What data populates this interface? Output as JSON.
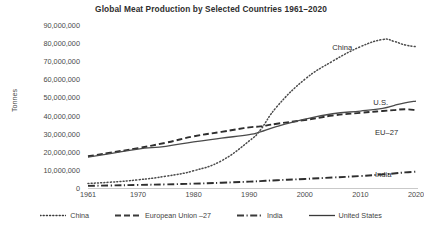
{
  "chart_data": {
    "type": "line",
    "title": "Global Meat Production by Selected Countries 1961–2020",
    "xlabel": "",
    "ylabel": "Tonnes",
    "xlim": [
      1961,
      2020
    ],
    "ylim": [
      0,
      90000000
    ],
    "grid": false,
    "legend_position": "bottom",
    "x_ticks": [
      "1961",
      "1970",
      "1980",
      "1990",
      "2000",
      "2010",
      "2020"
    ],
    "x_tick_values": [
      1961,
      1970,
      1980,
      1990,
      2000,
      2010,
      2020
    ],
    "y_ticks": [
      "90,000,000",
      "80,000,000",
      "70,000,000",
      "60,000,000",
      "50,000,000",
      "40,000,000",
      "30,000,000",
      "20,000,000",
      "10,000,000",
      "0"
    ],
    "y_tick_values": [
      90000000,
      80000000,
      70000000,
      60000000,
      50000000,
      40000000,
      30000000,
      20000000,
      10000000,
      0
    ],
    "x": [
      1961,
      1965,
      1970,
      1975,
      1980,
      1985,
      1990,
      1992,
      1995,
      2000,
      2005,
      2010,
      2014,
      2016,
      2018,
      2020
    ],
    "series": [
      {
        "name": "China",
        "style": "dotted",
        "color": "#4a4a4a",
        "values": [
          2500000,
          3200000,
          4500000,
          6500000,
          9500000,
          15000000,
          26000000,
          32000000,
          45000000,
          60000000,
          70000000,
          78000000,
          82000000,
          81000000,
          79000000,
          78000000
        ]
      },
      {
        "name": "European Union –27",
        "style": "dashed",
        "color": "#2e2e2e",
        "values": [
          17500000,
          19500000,
          22000000,
          25000000,
          28500000,
          31000000,
          33500000,
          34000000,
          35500000,
          37500000,
          40000000,
          41500000,
          42500000,
          43000000,
          43500000,
          43000000
        ]
      },
      {
        "name": "India",
        "style": "dashdot",
        "color": "#2e2e2e",
        "values": [
          1200000,
          1400000,
          1700000,
          2000000,
          2400000,
          2900000,
          3500000,
          3800000,
          4300000,
          5000000,
          5800000,
          6600000,
          7500000,
          8000000,
          8600000,
          9000000
        ]
      },
      {
        "name": "United States",
        "style": "solid",
        "color": "#4a4a4a",
        "values": [
          17000000,
          19000000,
          21500000,
          23000000,
          25500000,
          27500000,
          29500000,
          31000000,
          34000000,
          38000000,
          41000000,
          42500000,
          44000000,
          45500000,
          47000000,
          48000000
        ]
      }
    ],
    "series_labels": [
      {
        "text": "China",
        "x_pct": 74.5,
        "y_pct": 11.0
      },
      {
        "text": "U.S.",
        "x_pct": 87.0,
        "y_pct": 44.5
      },
      {
        "text": "EU–27",
        "x_pct": 87.5,
        "y_pct": 63.0
      },
      {
        "text": "India",
        "x_pct": 87.5,
        "y_pct": 89.0
      }
    ],
    "legend": [
      {
        "label": "China",
        "style": "dotted"
      },
      {
        "label": "European Union –27",
        "style": "dashed"
      },
      {
        "label": "India",
        "style": "dashdot"
      },
      {
        "label": "United States",
        "style": "solid"
      }
    ]
  }
}
